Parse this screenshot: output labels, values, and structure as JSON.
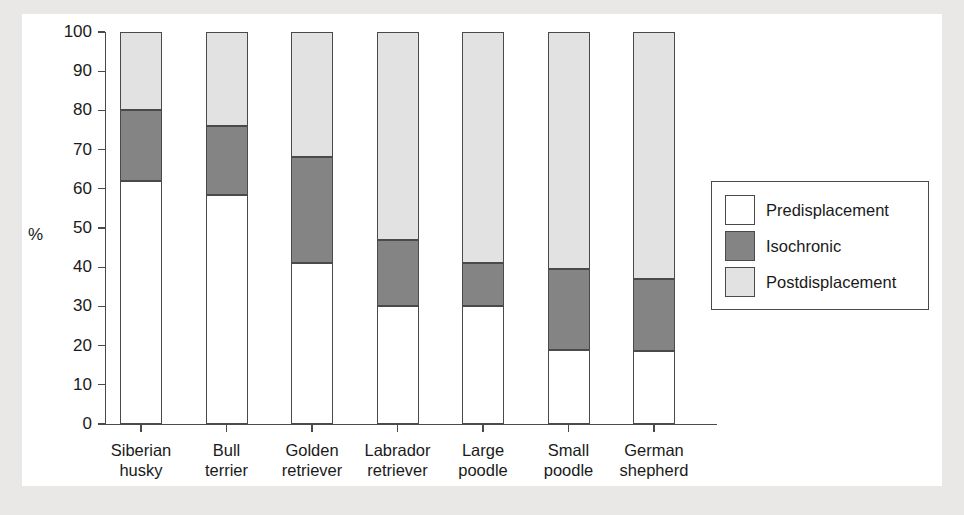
{
  "chart_data": {
    "type": "bar",
    "subtype": "stacked-bar-100",
    "title": "",
    "xlabel": "",
    "ylabel": "%",
    "ylim": [
      0,
      100
    ],
    "ytick_values": [
      0,
      10,
      20,
      30,
      40,
      50,
      60,
      70,
      80,
      90,
      100
    ],
    "ytick_labels": [
      "0",
      "10",
      "20",
      "30",
      "40",
      "50",
      "60",
      "70",
      "80",
      "90",
      "100"
    ],
    "grid": false,
    "legend_position": "right",
    "categories": [
      "Siberian husky",
      "Bull terrier",
      "Golden retriever",
      "Labrador retriever",
      "Large poodle",
      "Small poodle",
      "German shepherd"
    ],
    "category_lines": [
      [
        "Siberian",
        "husky"
      ],
      [
        "Bull",
        "terrier"
      ],
      [
        "Golden",
        "retriever"
      ],
      [
        "Labrador",
        "retriever"
      ],
      [
        "Large",
        "poodle"
      ],
      [
        "Small",
        "poodle"
      ],
      [
        "German",
        "shepherd"
      ]
    ],
    "series": [
      {
        "name": "Predisplacement",
        "color": "#ffffff",
        "values": [
          62,
          58.5,
          41,
          30,
          30,
          19,
          18.5
        ]
      },
      {
        "name": "Isochronic",
        "color": "#848484",
        "values": [
          18,
          17.5,
          27,
          17,
          11,
          20.5,
          18.5
        ]
      },
      {
        "name": "Postdisplacement",
        "color": "#e2e2e2",
        "values": [
          20,
          24,
          32,
          53,
          59,
          60.5,
          63
        ]
      }
    ],
    "cumulative_tops": [
      {
        "category": "Siberian husky",
        "pre_top": 62,
        "iso_top": 80,
        "post_top": 100
      },
      {
        "category": "Bull terrier",
        "pre_top": 58.5,
        "iso_top": 76,
        "post_top": 100
      },
      {
        "category": "Golden retriever",
        "pre_top": 41,
        "iso_top": 68,
        "post_top": 100
      },
      {
        "category": "Labrador retriever",
        "pre_top": 30,
        "iso_top": 47,
        "post_top": 100
      },
      {
        "category": "Large poodle",
        "pre_top": 30,
        "iso_top": 41,
        "post_top": 100
      },
      {
        "category": "Small poodle",
        "pre_top": 19,
        "iso_top": 39.5,
        "post_top": 100
      },
      {
        "category": "German shepherd",
        "pre_top": 18.5,
        "iso_top": 37,
        "post_top": 100
      }
    ]
  },
  "legend": {
    "entries": [
      {
        "label": "Predisplacement",
        "swatch": "pre"
      },
      {
        "label": "Isochronic",
        "swatch": "iso"
      },
      {
        "label": "Postdisplacement",
        "swatch": "post"
      }
    ]
  },
  "colors": {
    "predisplacement": "#ffffff",
    "isochronic": "#848484",
    "postdisplacement": "#e2e2e2",
    "axis": "#4a4a4a",
    "text": "#1a1a1a",
    "page_background": "#e9e8e6",
    "panel_background": "#ffffff"
  }
}
